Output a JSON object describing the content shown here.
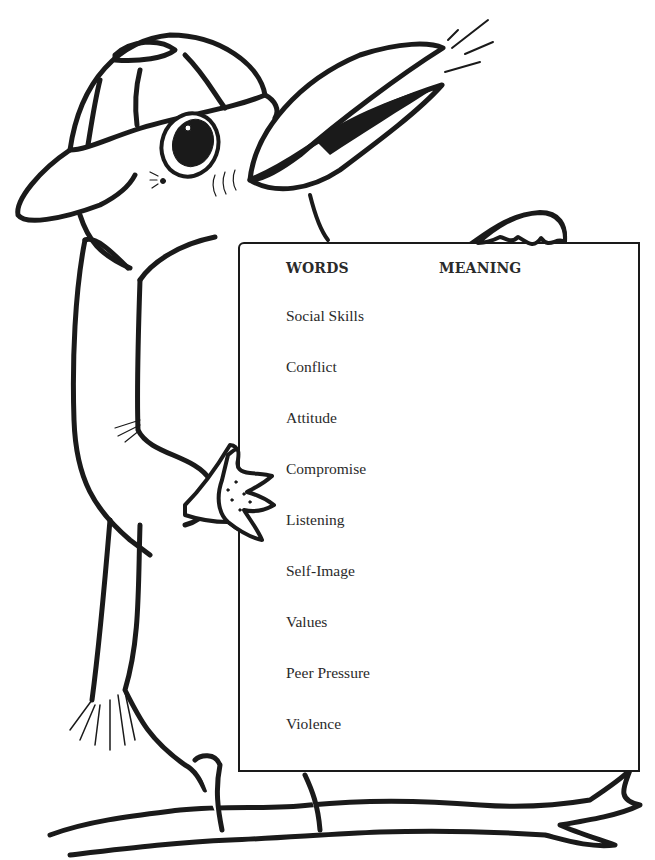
{
  "worksheet": {
    "headers": {
      "words": "WORDS",
      "meaning": "MEANING"
    },
    "words": [
      "Social Skills",
      "Conflict",
      "Attitude",
      "Compromise",
      "Listening",
      "Self-Image",
      "Values",
      "Peer Pressure",
      "Violence"
    ],
    "meanings": [
      "",
      "",
      "",
      "",
      "",
      "",
      "",
      "",
      ""
    ]
  },
  "illustration": {
    "subject": "bird-wearing-cap-holding-sign",
    "perch": "tree-branch",
    "line_color": "#1a1a1a",
    "paper_color": "#ffffff"
  }
}
